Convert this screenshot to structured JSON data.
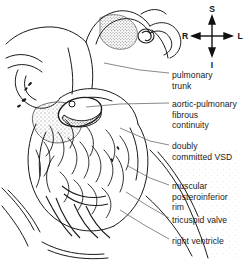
{
  "figure": {
    "background_color": "#ffffff",
    "ink_color": "#1a1a1a",
    "leader_color": "#6b6b6b"
  },
  "compass": {
    "name": "orientation-compass",
    "superior": "S",
    "inferior": "I",
    "right": "R",
    "left": "L"
  },
  "labels": [
    {
      "id": "pulmonary-trunk",
      "lines": [
        "pulmonary",
        "trunk"
      ],
      "x": 172,
      "y": 70
    },
    {
      "id": "aortic-pulmonary-continuity",
      "lines": [
        "aortic-pulmonary",
        "fibrous",
        "continuity"
      ],
      "x": 172,
      "y": 99
    },
    {
      "id": "doubly-committed-vsd",
      "lines": [
        "doubly",
        "committed VSD"
      ],
      "x": 172,
      "y": 141
    },
    {
      "id": "muscular-posteroinferior-rim",
      "lines": [
        "muscular",
        "posteroinferior",
        "rim"
      ],
      "x": 172,
      "y": 181
    },
    {
      "id": "tricuspid-valve",
      "lines": [
        "tricuspid valve"
      ],
      "x": 172,
      "y": 215
    },
    {
      "id": "right-ventricle",
      "lines": [
        "right ventricle"
      ],
      "x": 172,
      "y": 236
    }
  ],
  "leaders": [
    {
      "id": "leader-pulmonary-trunk",
      "d": "M169,73 L140,70 L104,63"
    },
    {
      "id": "leader-aortic-pulmonary-continuity",
      "d": "M169,103 L120,104 L86,107"
    },
    {
      "id": "leader-doubly-committed-vsd",
      "d": "M169,145 L150,141 L120,128"
    },
    {
      "id": "leader-muscular-rim",
      "d": "M169,185 L150,178 L128,166"
    },
    {
      "id": "leader-tricuspid-valve",
      "d": "M169,218 L148,206 L126,192"
    },
    {
      "id": "leader-right-ventricle",
      "d": "M169,239 L146,226 L120,210"
    }
  ]
}
